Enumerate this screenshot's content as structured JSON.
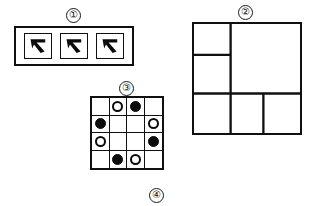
{
  "document": {
    "title": "Four-part black and white line diagram",
    "background_color": "#ffffff",
    "ink_color": "#101010"
  },
  "labels": {
    "figure_1": "①",
    "figure_2": "②",
    "figure_3": "③",
    "figure_4": "④"
  },
  "figure_1": {
    "label": "①",
    "description": "Horizontal rectangle containing three bordered square cells",
    "cell_count": 3,
    "cells": [
      {
        "index": 1,
        "glyph": "bent-arrow-glyph"
      },
      {
        "index": 2,
        "glyph": "bent-arrow-glyph"
      },
      {
        "index": 3,
        "glyph": "bent-arrow-glyph"
      }
    ]
  },
  "figure_2": {
    "label": "②",
    "description": "Large square subdivided into five rectangular regions",
    "regions": [
      {
        "name": "top-left",
        "x": 0,
        "y": 0,
        "w": 38,
        "h": 32
      },
      {
        "name": "middle-left",
        "x": 0,
        "y": 32,
        "w": 38,
        "h": 40
      },
      {
        "name": "right-large",
        "x": 38,
        "y": 0,
        "w": 72,
        "h": 72
      },
      {
        "name": "bottom-left",
        "x": 0,
        "y": 72,
        "w": 38,
        "h": 41
      },
      {
        "name": "bottom-mid",
        "x": 38,
        "y": 72,
        "w": 34,
        "h": 41
      },
      {
        "name": "bottom-right",
        "x": 72,
        "y": 72,
        "w": 38,
        "h": 41
      }
    ]
  },
  "figure_3": {
    "label": "③",
    "description": "Four by four grid of cells holding black, white and empty discs",
    "rows": 4,
    "columns": 4,
    "cells": [
      "empty",
      "white",
      "black",
      "empty",
      "black",
      "empty",
      "empty",
      "white",
      "white",
      "empty",
      "empty",
      "black",
      "empty",
      "black",
      "white",
      "empty"
    ]
  },
  "figure_4": {
    "label": "④",
    "description": "Standalone circled numeral four label"
  }
}
